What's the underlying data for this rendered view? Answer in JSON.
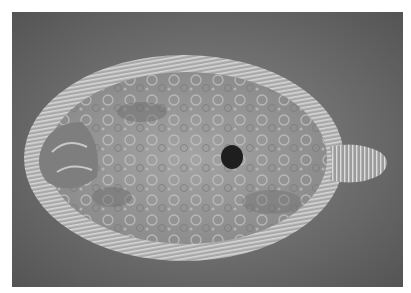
{
  "image": {
    "subject": "flatfish (flounder) photographed from above",
    "style": "grayscale photograph",
    "colors": {
      "border": "#ffffff",
      "background": "#6c6c6c",
      "body": "#9a9a9a",
      "fin": "#bdbdbd",
      "spot": "#1e1e1e"
    }
  }
}
